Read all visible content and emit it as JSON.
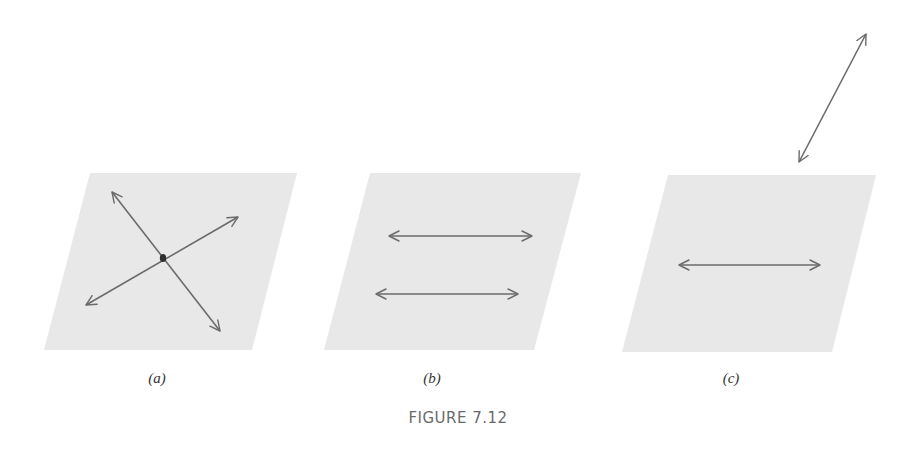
{
  "figure": {
    "caption": "FIGURE 7.12",
    "colors": {
      "plane_fill": "#e8e8e8",
      "arrow_stroke": "#6b6b6b",
      "point_fill": "#2f2f2f",
      "caption_text": "#6a6a6a",
      "label_text": "#333333"
    },
    "panels": [
      {
        "id": "a",
        "label": "(a)",
        "label_pos": [
          157,
          370
        ],
        "plane": [
          [
            90,
            173
          ],
          [
            297,
            173
          ],
          [
            252,
            350
          ],
          [
            44,
            350
          ]
        ],
        "point": [
          163,
          258
        ],
        "arrows": [
          {
            "from": [
              112,
              192
            ],
            "to": [
              220,
              331
            ],
            "description": "line through point, upper-left to lower-right"
          },
          {
            "from": [
              86,
              305
            ],
            "to": [
              238,
              217
            ],
            "description": "line through point, lower-left to upper-right"
          }
        ]
      },
      {
        "id": "b",
        "label": "(b)",
        "label_pos": [
          432,
          370
        ],
        "plane": [
          [
            370,
            173
          ],
          [
            581,
            173
          ],
          [
            534,
            350
          ],
          [
            324,
            350
          ]
        ],
        "arrows": [
          {
            "from": [
              389,
              236
            ],
            "to": [
              532,
              236
            ],
            "description": "upper horizontal line"
          },
          {
            "from": [
              376,
              294
            ],
            "to": [
              518,
              294
            ],
            "description": "lower parallel horizontal line"
          }
        ]
      },
      {
        "id": "c",
        "label": "(c)",
        "label_pos": [
          731,
          370
        ],
        "plane": [
          [
            668,
            175
          ],
          [
            876,
            175
          ],
          [
            832,
            352
          ],
          [
            622,
            352
          ]
        ],
        "arrows": [
          {
            "from": [
              679,
              265
            ],
            "to": [
              820,
              265
            ],
            "description": "horizontal line in plane"
          },
          {
            "from": [
              799,
              162
            ],
            "to": [
              866,
              34
            ],
            "description": "skew line outside the plane"
          }
        ]
      }
    ]
  }
}
